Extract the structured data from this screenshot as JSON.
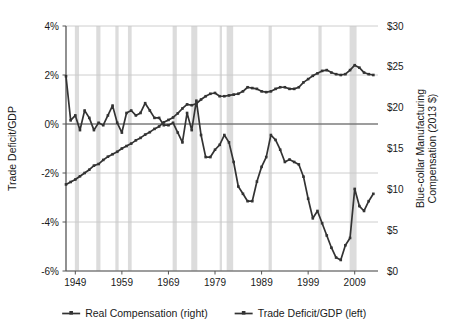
{
  "chart_data": {
    "type": "line",
    "title": "",
    "xlabel": "",
    "ylabel": "Trade Deficit/GDP",
    "y2label": "Blue-collar Manufacturing Compensation (2013 $)",
    "grid": true,
    "legend_position": "bottom",
    "xlim": [
      1947,
      2014
    ],
    "xticks": [
      "1949",
      "1959",
      "1969",
      "1979",
      "1989",
      "1999",
      "2009"
    ],
    "xtick_values": [
      1949,
      1959,
      1969,
      1979,
      1989,
      1999,
      2009
    ],
    "ylim": [
      -6,
      4
    ],
    "yticks": [
      "-6%",
      "-4%",
      "-2%",
      "0%",
      "2%",
      "4%"
    ],
    "ytick_values": [
      -6,
      -4,
      -2,
      0,
      2,
      4
    ],
    "y2lim": [
      0,
      30
    ],
    "y2ticks": [
      "$0",
      "$5",
      "$10",
      "$15",
      "$20",
      "$25",
      "$30"
    ],
    "y2tick_values": [
      0,
      5,
      10,
      15,
      20,
      25,
      30
    ],
    "recession_bands": [
      [
        1948.9,
        1949.8
      ],
      [
        1953.5,
        1954.4
      ],
      [
        1957.6,
        1958.3
      ],
      [
        1960.3,
        1961.1
      ],
      [
        1969.9,
        1970.8
      ],
      [
        1973.9,
        1975.2
      ],
      [
        1980.0,
        1980.5
      ],
      [
        1981.5,
        1982.9
      ],
      [
        1990.5,
        1991.2
      ],
      [
        2001.2,
        2001.9
      ],
      [
        2007.9,
        2009.4
      ]
    ],
    "series": [
      {
        "name": "Trade Deficit/GDP (left)",
        "axis": "left",
        "color": "#333333",
        "x": [
          1947,
          1948,
          1949,
          1950,
          1951,
          1952,
          1953,
          1954,
          1955,
          1956,
          1957,
          1958,
          1959,
          1960,
          1961,
          1962,
          1963,
          1964,
          1965,
          1966,
          1967,
          1968,
          1969,
          1970,
          1971,
          1972,
          1973,
          1974,
          1975,
          1976,
          1977,
          1978,
          1979,
          1980,
          1981,
          1982,
          1983,
          1984,
          1985,
          1986,
          1987,
          1988,
          1989,
          1990,
          1991,
          1992,
          1993,
          1994,
          1995,
          1996,
          1997,
          1998,
          1999,
          2000,
          2001,
          2002,
          2003,
          2004,
          2005,
          2006,
          2007,
          2008,
          2009,
          2010,
          2011,
          2012,
          2013
        ],
        "values": [
          1.95,
          0.15,
          0.35,
          -0.25,
          0.55,
          0.25,
          -0.25,
          0.05,
          -0.05,
          0.35,
          0.75,
          0.05,
          -0.35,
          0.45,
          0.55,
          0.35,
          0.45,
          0.85,
          0.55,
          0.25,
          0.25,
          -0.05,
          -0.05,
          0.05,
          -0.35,
          -0.75,
          0.45,
          -0.25,
          0.95,
          -0.45,
          -1.35,
          -1.35,
          -1.05,
          -0.85,
          -0.45,
          -0.75,
          -1.55,
          -2.55,
          -2.85,
          -3.15,
          -3.15,
          -2.35,
          -1.75,
          -1.35,
          -0.45,
          -0.65,
          -1.05,
          -1.55,
          -1.45,
          -1.55,
          -1.65,
          -2.15,
          -3.05,
          -3.85,
          -3.55,
          -4.05,
          -4.55,
          -5.05,
          -5.45,
          -5.55,
          -4.95,
          -4.65,
          -2.65,
          -3.35,
          -3.55,
          -3.15,
          -2.85
        ]
      },
      {
        "name": "Real Compensation (right)",
        "axis": "right",
        "color": "#333333",
        "x": [
          1947,
          1948,
          1949,
          1950,
          1951,
          1952,
          1953,
          1954,
          1955,
          1956,
          1957,
          1958,
          1959,
          1960,
          1961,
          1962,
          1963,
          1964,
          1965,
          1966,
          1967,
          1968,
          1969,
          1970,
          1971,
          1972,
          1973,
          1974,
          1975,
          1976,
          1977,
          1978,
          1979,
          1980,
          1981,
          1982,
          1983,
          1984,
          1985,
          1986,
          1987,
          1988,
          1989,
          1990,
          1991,
          1992,
          1993,
          1994,
          1995,
          1996,
          1997,
          1998,
          1999,
          2000,
          2001,
          2002,
          2003,
          2004,
          2005,
          2006,
          2007,
          2008,
          2009,
          2010,
          2011,
          2012,
          2013
        ],
        "values": [
          10.6,
          10.9,
          11.2,
          11.6,
          12.0,
          12.4,
          12.9,
          13.1,
          13.6,
          14.0,
          14.3,
          14.6,
          15.0,
          15.3,
          15.6,
          16.0,
          16.3,
          16.7,
          17.0,
          17.4,
          17.7,
          18.2,
          18.5,
          18.8,
          19.3,
          19.9,
          20.4,
          20.3,
          20.5,
          21.0,
          21.4,
          21.7,
          21.8,
          21.4,
          21.4,
          21.5,
          21.6,
          21.7,
          22.0,
          22.5,
          22.4,
          22.3,
          22.0,
          21.9,
          22.0,
          22.3,
          22.5,
          22.5,
          22.3,
          22.3,
          22.5,
          23.1,
          23.5,
          23.9,
          24.2,
          24.5,
          24.6,
          24.3,
          24.1,
          24.0,
          24.1,
          24.6,
          25.2,
          24.9,
          24.3,
          24.1,
          24.0
        ]
      }
    ],
    "legend": [
      {
        "label": "Real Compensation (right)",
        "color": "#333333"
      },
      {
        "label": "Trade Deficit/GDP (left)",
        "color": "#333333"
      }
    ],
    "colors": {
      "line": "#333333",
      "grid": "#c8c8c8",
      "axis": "#555555",
      "recession_band": "#dcdcdc",
      "text": "#1a1a1a",
      "background": "#ffffff"
    }
  }
}
